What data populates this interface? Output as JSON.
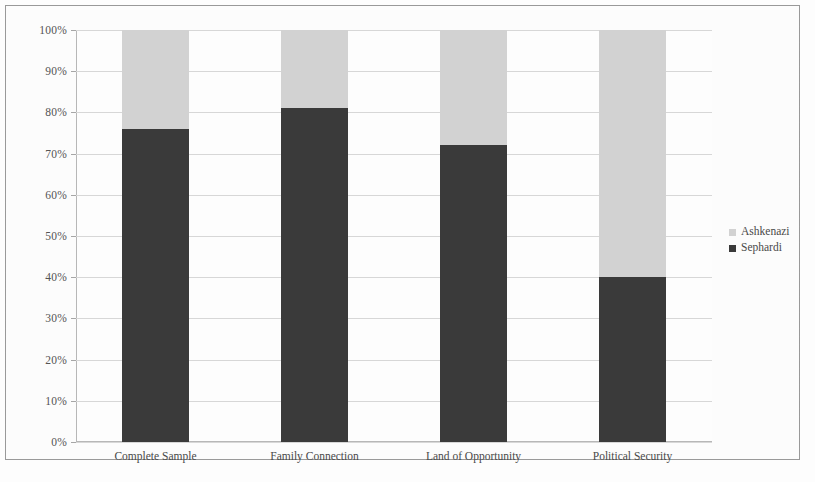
{
  "figure": {
    "background_color": "#ffffff",
    "border_color": "#9b9b9b"
  },
  "legend": {
    "position": "right",
    "entries": [
      {
        "label": "Ashkenazi",
        "color": "#d4d4d4",
        "marker": "square-light"
      },
      {
        "label": "Sephardi",
        "color": "#3a3a3a",
        "marker": "square-dark"
      }
    ]
  },
  "axis": {
    "y_tick_labels": [
      "0%",
      "10%",
      "20%",
      "30%",
      "40%",
      "50%",
      "60%",
      "70%",
      "80%",
      "90%",
      "100%"
    ],
    "y_tick_values": [
      0,
      10,
      20,
      30,
      40,
      50,
      60,
      70,
      80,
      90,
      100
    ]
  },
  "chart_data": {
    "type": "bar",
    "stacked": true,
    "stack_total": 100,
    "title": "",
    "subtitle": "",
    "xlabel": "",
    "ylabel": "",
    "ylim": [
      0,
      100
    ],
    "yticks": [
      0,
      10,
      20,
      30,
      40,
      50,
      60,
      70,
      80,
      90,
      100
    ],
    "ytick_labels": [
      "0%",
      "10%",
      "20%",
      "30%",
      "40%",
      "50%",
      "60%",
      "70%",
      "80%",
      "90%",
      "100%"
    ],
    "grid": true,
    "grid_axis": "y",
    "legend_position": "right",
    "categories": [
      "Complete Sample",
      "Family Connection",
      "Land of Opportunity",
      "Political Security"
    ],
    "series": [
      {
        "name": "Sephardi",
        "color": "#3a3a3a",
        "values": [
          76,
          81,
          72,
          40
        ]
      },
      {
        "name": "Ashkenazi",
        "color": "#d4d4d4",
        "values": [
          24,
          19,
          28,
          60
        ]
      }
    ],
    "annotations": []
  }
}
